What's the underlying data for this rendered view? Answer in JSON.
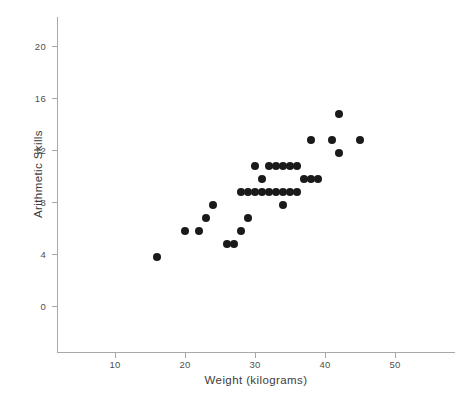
{
  "chart_data": {
    "type": "scatter",
    "title": "",
    "subtitle": "",
    "xlabel": "Weight (kilograms)",
    "ylabel": "Arithmetic Skills",
    "xlim": [
      0,
      57
    ],
    "ylim": [
      -1,
      22.5
    ],
    "xticks": [
      10,
      20,
      30,
      40,
      50
    ],
    "yticks": [
      0,
      4,
      8,
      12,
      16,
      20
    ],
    "xtick_labels": [
      "10",
      "20",
      "30",
      "40",
      "50"
    ],
    "ytick_labels": [
      "0",
      "4",
      "8",
      "12",
      "16",
      "20"
    ],
    "grid": false,
    "legend": null,
    "marker": {
      "shape": "circle",
      "color": "#1a1a1a",
      "size": 8
    },
    "annotations": [],
    "n_points": 38,
    "points": [
      {
        "x": 16,
        "y": 4
      },
      {
        "x": 20,
        "y": 6
      },
      {
        "x": 22,
        "y": 6
      },
      {
        "x": 23,
        "y": 7
      },
      {
        "x": 24,
        "y": 8
      },
      {
        "x": 26,
        "y": 5
      },
      {
        "x": 27,
        "y": 5
      },
      {
        "x": 28,
        "y": 6
      },
      {
        "x": 28,
        "y": 9
      },
      {
        "x": 29,
        "y": 9
      },
      {
        "x": 29,
        "y": 7
      },
      {
        "x": 30,
        "y": 11
      },
      {
        "x": 30,
        "y": 9
      },
      {
        "x": 31,
        "y": 10
      },
      {
        "x": 31,
        "y": 9
      },
      {
        "x": 32,
        "y": 11
      },
      {
        "x": 32,
        "y": 9
      },
      {
        "x": 33,
        "y": 11
      },
      {
        "x": 33,
        "y": 9
      },
      {
        "x": 34,
        "y": 11
      },
      {
        "x": 34,
        "y": 9
      },
      {
        "x": 35,
        "y": 11
      },
      {
        "x": 35,
        "y": 9
      },
      {
        "x": 36,
        "y": 11
      },
      {
        "x": 36,
        "y": 9
      },
      {
        "x": 34,
        "y": 8
      },
      {
        "x": 37,
        "y": 10
      },
      {
        "x": 38,
        "y": 10
      },
      {
        "x": 39,
        "y": 10
      },
      {
        "x": 38,
        "y": 13
      },
      {
        "x": 41,
        "y": 13
      },
      {
        "x": 42,
        "y": 15
      },
      {
        "x": 42,
        "y": 12
      },
      {
        "x": 45,
        "y": 13
      }
    ]
  },
  "axis": {
    "y_title": "Arithmetic Skills",
    "x_title": "Weight (kilograms)",
    "tick_color": "#a8a8a8"
  }
}
